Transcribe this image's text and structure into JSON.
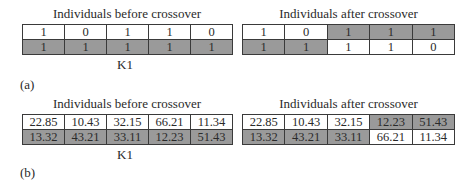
{
  "panel_a": {
    "label": "(a)",
    "before": {
      "title": "Individuals before crossover",
      "rows": [
        {
          "cells": [
            "1",
            "0",
            "1",
            "1",
            "0"
          ],
          "shade": [
            "w",
            "w",
            "w",
            "w",
            "w"
          ]
        },
        {
          "cells": [
            "1",
            "1",
            "1",
            "1",
            "1"
          ],
          "shade": [
            "g",
            "g",
            "g",
            "g",
            "g"
          ]
        }
      ],
      "marker": "K1"
    },
    "after": {
      "title": "Individuals after crossover",
      "rows": [
        {
          "cells": [
            "1",
            "0",
            "1",
            "1",
            "1"
          ],
          "shade": [
            "w",
            "w",
            "g",
            "g",
            "g"
          ]
        },
        {
          "cells": [
            "1",
            "1",
            "1",
            "1",
            "0"
          ],
          "shade": [
            "g",
            "g",
            "w",
            "w",
            "w"
          ]
        }
      ]
    }
  },
  "panel_b": {
    "label": "(b)",
    "before": {
      "title": "Individuals before crossover",
      "rows": [
        {
          "cells": [
            "22.85",
            "10.43",
            "32.15",
            "66.21",
            "11.34"
          ],
          "shade": [
            "w",
            "w",
            "w",
            "w",
            "w"
          ]
        },
        {
          "cells": [
            "13.32",
            "43.21",
            "33.11",
            "12.23",
            "51.43"
          ],
          "shade": [
            "g",
            "g",
            "g",
            "g",
            "g"
          ]
        }
      ],
      "marker": "K1"
    },
    "after": {
      "title": "Individuals after crossover",
      "rows": [
        {
          "cells": [
            "22.85",
            "10.43",
            "32.15",
            "12.23",
            "51.43"
          ],
          "shade": [
            "w",
            "w",
            "w",
            "g",
            "g"
          ]
        },
        {
          "cells": [
            "13.32",
            "43.21",
            "33.11",
            "66.21",
            "11.34"
          ],
          "shade": [
            "g",
            "g",
            "g",
            "w",
            "w"
          ]
        }
      ]
    }
  },
  "colors": {
    "shaded": "#9a9a9a",
    "plain": "#ffffff",
    "border": "#3a3a3a"
  }
}
